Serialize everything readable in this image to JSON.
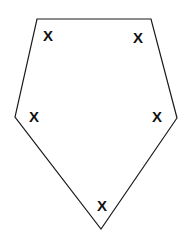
{
  "figure": {
    "kind": "geometry-diagram",
    "canvas": {
      "width": 189,
      "height": 245,
      "background": "#ffffff"
    },
    "polygon": {
      "name": "pentagon",
      "sides": 5,
      "stroke_color": "#1a1a1a",
      "stroke_width": 1.2,
      "fill": "none",
      "points": "37,19 151,19 177,118 101,229 15,117",
      "vertices": [
        {
          "label": "top-left",
          "x": 37,
          "y": 19
        },
        {
          "label": "top-right",
          "x": 151,
          "y": 19
        },
        {
          "label": "right",
          "x": 177,
          "y": 118
        },
        {
          "label": "bottom",
          "x": 101,
          "y": 229
        },
        {
          "label": "left",
          "x": 15,
          "y": 117
        }
      ]
    },
    "marks": [
      {
        "id": "mark-top-left",
        "glyph": "X",
        "x": 48,
        "y": 35,
        "near_vertex": "top-left"
      },
      {
        "id": "mark-top-right",
        "glyph": "X",
        "x": 138,
        "y": 37,
        "near_vertex": "top-right"
      },
      {
        "id": "mark-left",
        "glyph": "X",
        "x": 34,
        "y": 116,
        "near_vertex": "left"
      },
      {
        "id": "mark-right",
        "glyph": "X",
        "x": 157,
        "y": 116,
        "near_vertex": "right"
      },
      {
        "id": "mark-bottom",
        "glyph": "X",
        "x": 102,
        "y": 205,
        "near_vertex": "bottom"
      }
    ]
  }
}
